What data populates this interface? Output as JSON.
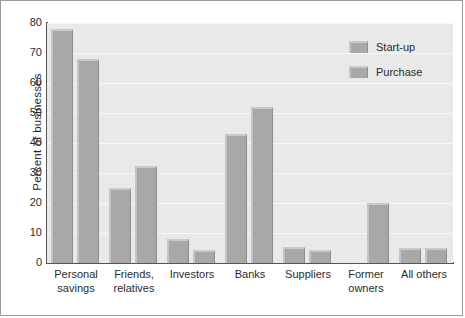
{
  "chart_data": {
    "type": "bar",
    "title": "",
    "subtitle": "",
    "xlabel": "",
    "ylabel": "Percent of businesses",
    "ylim": [
      0,
      80
    ],
    "ytick_step": 10,
    "yticks": [
      80,
      70,
      60,
      50,
      40,
      30,
      20,
      10,
      0
    ],
    "grid": true,
    "grid_axis": "y",
    "legend_position": "top-right",
    "categories": [
      "Personal savings",
      "Friends, relatives",
      "Investors",
      "Banks",
      "Suppliers",
      "Former owners",
      "All others"
    ],
    "category_lines": [
      [
        "Personal",
        "savings"
      ],
      [
        "Friends,",
        "relatives"
      ],
      [
        "Investors",
        ""
      ],
      [
        "Banks",
        ""
      ],
      [
        "Suppliers",
        ""
      ],
      [
        "Former",
        "owners"
      ],
      [
        "All others",
        ""
      ]
    ],
    "series": [
      {
        "name": "Start-up",
        "color": "#a8a8a8",
        "values": [
          78,
          25,
          8,
          43,
          5.5,
          0,
          5
        ]
      },
      {
        "name": "Purchase",
        "color": "#a8a8a8",
        "values": [
          68,
          32.5,
          4.5,
          52,
          4.5,
          20,
          5
        ]
      }
    ]
  },
  "legend": {
    "items": [
      {
        "label": "Start-up"
      },
      {
        "label": "Purchase"
      }
    ]
  },
  "colors": {
    "bar_face": "#a8a8a8",
    "bar_highlight": "#c9c9c9",
    "bar_shadow": "#8d8d8d",
    "plot_background": "#e9e9e9",
    "gridline": "#f7f7f7",
    "axis": "#555555",
    "frame": "#9a9a9a",
    "text": "#2b2b2b"
  }
}
